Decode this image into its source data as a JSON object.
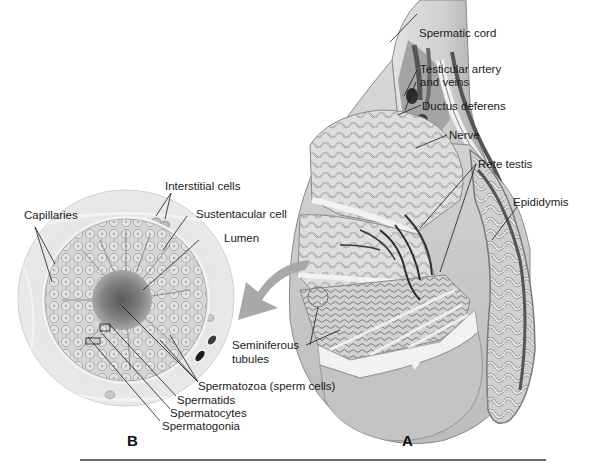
{
  "figure": {
    "panel_a": {
      "letter": "A",
      "description": "Cutaway of testis with spermatic cord and epididymis",
      "labels": {
        "spermatic_cord": "Spermatic cord",
        "testicular_artery_line1": "Testicular artery",
        "testicular_artery_line2": "and veins",
        "ductus_deferens": "Ductus deferens",
        "nerve": "Nerve",
        "rete_testis": "Rete testis",
        "epididymis": "Epididymis",
        "seminiferous_line1": "Seminiferous",
        "seminiferous_line2": "tubules"
      }
    },
    "panel_b": {
      "letter": "B",
      "description": "Magnified cross-section of a seminiferous tubule",
      "labels": {
        "interstitial_cells": "Interstitial cells",
        "capillaries": "Capillaries",
        "sustentacular_cell": "Sustentacular cell",
        "lumen": "Lumen",
        "spermatozoa": "Spermatozoa (sperm cells)",
        "spermatids": "Spermatids",
        "spermatocytes": "Spermatocytes",
        "spermatogonia": "Spermatogonia"
      }
    },
    "colors": {
      "tissue_light": "#e6e6e6",
      "tissue_mid": "#bdbdbd",
      "tissue_dark": "#6e6e6e",
      "arrow": "#a9a9a9",
      "leader_line": "#1a1a1a"
    }
  }
}
